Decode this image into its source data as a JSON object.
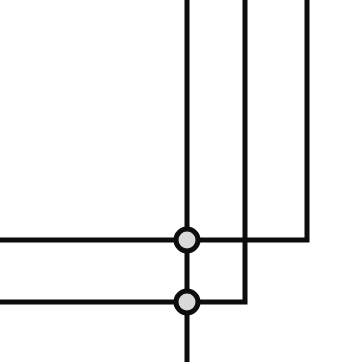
{
  "canvas": {
    "width": 337,
    "height": 362,
    "background": "#ffffff",
    "title": "Junction Connection Diagram"
  },
  "style": {
    "line_color": "#0d0d0d",
    "line_width": 5,
    "node_fill": "#d9d9d9",
    "node_stroke": "#0d0d0d",
    "node_stroke_width": 5,
    "node_radius": 11
  },
  "nodes": [
    {
      "id": "junction-upper",
      "label": "Upper junction node",
      "cx": 187,
      "cy": 240,
      "r": 11,
      "fill": "#d9d9d9",
      "stroke": "#0d0d0d"
    },
    {
      "id": "junction-lower",
      "label": "Lower junction node",
      "cx": 187,
      "cy": 302,
      "r": 11,
      "fill": "#d9d9d9",
      "stroke": "#0d0d0d"
    }
  ],
  "edges": [
    {
      "id": "vertical-trunk-top",
      "label": "Vertical trunk from top edge to upper junction",
      "orientation": "vertical",
      "points": "187,0 187,240"
    },
    {
      "id": "vertical-trunk-middle",
      "label": "Vertical link between upper and lower junction",
      "orientation": "vertical",
      "points": "187,240 187,302"
    },
    {
      "id": "vertical-trunk-bottom",
      "label": "Vertical trunk from lower junction to bottom edge",
      "orientation": "vertical",
      "points": "187,302 187,362"
    },
    {
      "id": "horizontal-upper-left",
      "label": "Horizontal branch from left edge to upper junction",
      "orientation": "horizontal",
      "points": "0,240 187,240"
    },
    {
      "id": "horizontal-lower-left",
      "label": "Horizontal branch from left edge to lower junction",
      "orientation": "horizontal",
      "points": "0,302 187,302"
    },
    {
      "id": "branch-second-elbow",
      "label": "Second vertical line elbow into lower junction",
      "orientation": "elbow",
      "points": "245,0 245,302 187,302"
    },
    {
      "id": "branch-third-elbow",
      "label": "Third vertical line elbow into upper junction",
      "orientation": "elbow",
      "points": "307,0 307,240 187,240"
    }
  ]
}
